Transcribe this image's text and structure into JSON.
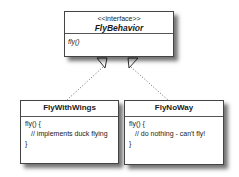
{
  "diagram": {
    "type": "uml-class",
    "interface": {
      "stereotype": "<<interface>>",
      "name": "FlyBehavior",
      "methods": [
        "fly()"
      ]
    },
    "classes": [
      {
        "name": "FlyWithWings",
        "body": [
          "fly() {",
          "// implements duck flying",
          "}"
        ]
      },
      {
        "name": "FlyNoWay",
        "body": [
          "fly() {",
          "// do nothing - can't fly!",
          "}"
        ]
      }
    ],
    "relations": [
      {
        "from": "FlyWithWings",
        "to": "FlyBehavior",
        "kind": "realization"
      },
      {
        "from": "FlyNoWay",
        "to": "FlyBehavior",
        "kind": "realization"
      }
    ],
    "colors": {
      "border": "#444444",
      "background": "#ffffff",
      "text": "#1a1a1a"
    }
  }
}
